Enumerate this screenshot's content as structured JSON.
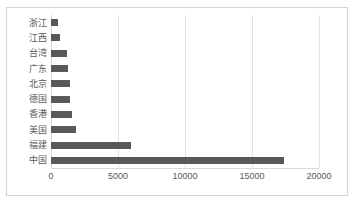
{
  "chart_data": {
    "type": "bar",
    "orientation": "horizontal",
    "title": "",
    "subtitle": "",
    "xlabel": "",
    "ylabel": "",
    "xlim": [
      0,
      20000
    ],
    "x_ticks": [
      0,
      5000,
      10000,
      15000,
      20000
    ],
    "x_tick_labels": [
      "0",
      "5000",
      "10000",
      "15000",
      "20000"
    ],
    "grid": true,
    "grid_axis": "x",
    "legend": false,
    "legend_position": "none",
    "bar_color": "#595959",
    "gridline_color": "#e3e3e3",
    "label_color": "#5a5a5a",
    "border_color": "#d4d4d4",
    "categories": [
      "浙江",
      "江西",
      "台湾",
      "广东",
      "北京",
      "德国",
      "香港",
      "美国",
      "福建",
      "中国"
    ],
    "values": [
      550,
      700,
      1200,
      1250,
      1400,
      1400,
      1550,
      1900,
      6000,
      17400
    ],
    "series": [
      {
        "name": "",
        "values": [
          550,
          700,
          1200,
          1250,
          1400,
          1400,
          1550,
          1900,
          6000,
          17400
        ]
      }
    ]
  }
}
